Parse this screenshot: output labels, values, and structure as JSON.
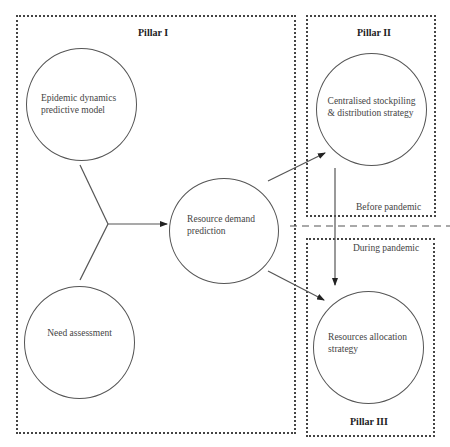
{
  "diagram": {
    "pillars": [
      {
        "id": "pillar-1",
        "label": "Pillar I"
      },
      {
        "id": "pillar-2",
        "label": "Pillar II"
      },
      {
        "id": "pillar-3",
        "label": "Pillar III"
      }
    ],
    "nodes": [
      {
        "id": "epidemic",
        "label": "Epidemic dynamics predictive model",
        "pillar": "Pillar I"
      },
      {
        "id": "need",
        "label": "Need assessment",
        "pillar": "Pillar I"
      },
      {
        "id": "demand",
        "label": "Resource demand prediction",
        "pillar": "Pillar I"
      },
      {
        "id": "stockpile",
        "label": "Centralised stockpiling & distribution strategy",
        "pillar": "Pillar II"
      },
      {
        "id": "allocation",
        "label": "Resources allocation strategy",
        "pillar": "Pillar III"
      }
    ],
    "phases": {
      "before": "Before pandemic",
      "during": "During pandemic"
    },
    "edges": [
      {
        "from": "epidemic",
        "to": "demand",
        "style": "merge"
      },
      {
        "from": "need",
        "to": "demand",
        "style": "merge"
      },
      {
        "from": "demand",
        "to": "stockpile",
        "style": "arrow"
      },
      {
        "from": "demand",
        "to": "allocation",
        "style": "arrow"
      },
      {
        "from": "stockpile",
        "to": "allocation",
        "style": "arrow"
      }
    ],
    "colors": {
      "line": "#444444",
      "text": "#333333",
      "background": "#ffffff"
    }
  },
  "text": {
    "pillar1": "Pillar I",
    "pillar2": "Pillar II",
    "pillar3": "Pillar III",
    "epidemic_line1": "Epidemic dynamics",
    "epidemic_line2": "predictive model",
    "need": "Need assessment",
    "demand_line1": "Resource demand",
    "demand_line2": "prediction",
    "stockpile_line1": "Centralised stockpiling",
    "stockpile_line2": "& distribution strategy",
    "allocation_line1": "Resources allocation",
    "allocation_line2": "strategy",
    "before": "Before pandemic",
    "during": "During pandemic"
  }
}
